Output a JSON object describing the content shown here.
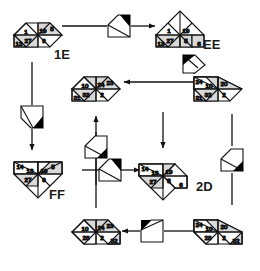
{
  "diagram": {
    "type": "node-link",
    "style": {
      "node_fill_light": "#ffffff",
      "node_fill_shaded": "#d8d8d8",
      "stroke": "#1a1a1a",
      "marker_black": "#000000",
      "background": "#ffffff"
    },
    "labels": [
      {
        "name": "label-1e",
        "text": "1E",
        "x": 54,
        "y": 55
      },
      {
        "name": "label-ee",
        "text": "EE",
        "x": 203,
        "y": 43
      },
      {
        "name": "label-ff",
        "text": "FF",
        "x": 49,
        "y": 191
      },
      {
        "name": "label-2d",
        "text": "2D",
        "x": 196,
        "y": 184
      }
    ],
    "nodes": [
      {
        "name": "node-top-left",
        "id": "n1",
        "cx": 38,
        "cy": 35,
        "cells": [
          {
            "pos": "top-right",
            "value": "5",
            "shaded": false
          },
          {
            "pos": "upper-left",
            "value": "1",
            "shaded": false
          },
          {
            "pos": "upper-right",
            "value": "19",
            "shaded": true
          },
          {
            "pos": "lower-left",
            "value": "27",
            "shaded": true
          },
          {
            "pos": "lower-right",
            "value": "9",
            "shaded": false
          },
          {
            "pos": "bottom-left",
            "value": "13",
            "shaded": true
          }
        ]
      },
      {
        "name": "node-top-right",
        "id": "n2",
        "cx": 180,
        "cy": 35,
        "cells": [
          {
            "pos": "top-right",
            "value": "",
            "shaded": false
          },
          {
            "pos": "upper-left",
            "value": "1",
            "shaded": false
          },
          {
            "pos": "upper-right",
            "value": "19",
            "shaded": false
          },
          {
            "pos": "lower-left",
            "value": "27",
            "shaded": true
          },
          {
            "pos": "lower-right",
            "value": "5",
            "shaded": true
          },
          {
            "pos": "bottom-left",
            "value": "13",
            "shaded": true
          },
          {
            "pos": "bottom-right",
            "value": "6",
            "shaded": true
          }
        ]
      },
      {
        "name": "node-center-upper",
        "id": "n3",
        "cx": 96,
        "cy": 89,
        "cells": [
          {
            "pos": "top-right",
            "value": "23",
            "shaded": true
          },
          {
            "pos": "upper-left",
            "value": "10",
            "shaded": false
          },
          {
            "pos": "upper-right",
            "value": "24",
            "shaded": true
          },
          {
            "pos": "lower-left",
            "value": "32",
            "shaded": true
          },
          {
            "pos": "lower-right",
            "value": "2",
            "shaded": false
          },
          {
            "pos": "bottom-left",
            "value": "31",
            "shaded": false
          }
        ]
      },
      {
        "name": "node-right-upper",
        "id": "n4",
        "cx": 218,
        "cy": 89,
        "cells": [
          {
            "pos": "top-left",
            "value": "24",
            "shaded": true
          },
          {
            "pos": "upper-left",
            "value": "10",
            "shaded": false
          },
          {
            "pos": "upper-right",
            "value": "20",
            "shaded": true
          },
          {
            "pos": "lower-left",
            "value": "32",
            "shaded": true
          },
          {
            "pos": "lower-right",
            "value": "2",
            "shaded": false
          },
          {
            "pos": "bottom-left",
            "value": "31",
            "shaded": false
          }
        ]
      },
      {
        "name": "node-left-lower",
        "id": "n5",
        "cx": 38,
        "cy": 174,
        "cells": [
          {
            "pos": "top-left",
            "value": "14",
            "shaded": false
          },
          {
            "pos": "top-right",
            "value": "5",
            "shaded": false
          },
          {
            "pos": "upper-left",
            "value": "13",
            "shaded": false
          },
          {
            "pos": "upper-right",
            "value": "19",
            "shaded": true
          },
          {
            "pos": "lower-left",
            "value": "27",
            "shaded": true
          },
          {
            "pos": "lower-right",
            "value": "9",
            "shaded": false
          }
        ]
      },
      {
        "name": "node-center-lower",
        "id": "n6",
        "cx": 163,
        "cy": 176,
        "cells": [
          {
            "pos": "top-left",
            "value": "14",
            "shaded": false
          },
          {
            "pos": "upper-left",
            "value": "13",
            "shaded": false
          },
          {
            "pos": "upper-right",
            "value": "19",
            "shaded": true
          },
          {
            "pos": "lower-left",
            "value": "27",
            "shaded": true
          },
          {
            "pos": "lower-right",
            "value": "5",
            "shaded": false
          },
          {
            "pos": "bottom-right",
            "value": "6",
            "shaded": false
          }
        ]
      },
      {
        "name": "node-bottom-middle",
        "id": "n7",
        "cx": 96,
        "cy": 232,
        "cells": [
          {
            "pos": "top-right",
            "value": "23",
            "shaded": true
          },
          {
            "pos": "upper-left",
            "value": "10",
            "shaded": false
          },
          {
            "pos": "upper-right",
            "value": "24",
            "shaded": true
          },
          {
            "pos": "lower-left",
            "value": "28",
            "shaded": false
          },
          {
            "pos": "lower-right",
            "value": "2",
            "shaded": false
          },
          {
            "pos": "bottom-right",
            "value": "32",
            "shaded": true
          }
        ]
      },
      {
        "name": "node-bottom-right",
        "id": "n8",
        "cx": 218,
        "cy": 232,
        "cells": [
          {
            "pos": "top-left",
            "value": "24",
            "shaded": true
          },
          {
            "pos": "upper-left",
            "value": "10",
            "shaded": false
          },
          {
            "pos": "upper-right",
            "value": "20",
            "shaded": true
          },
          {
            "pos": "lower-left",
            "value": "28",
            "shaded": false
          },
          {
            "pos": "lower-right",
            "value": "2",
            "shaded": false
          },
          {
            "pos": "bottom-right",
            "value": "32",
            "shaded": true
          }
        ]
      }
    ],
    "markers": [
      {
        "name": "marker-top",
        "cx": 119,
        "cy": 26,
        "rot": 0,
        "corner": "top-right"
      },
      {
        "name": "marker-left-vertical",
        "cx": 32,
        "cy": 117,
        "rot": -90,
        "corner": "bottom-left"
      },
      {
        "name": "marker-ee-down",
        "cx": 194,
        "cy": 62,
        "rot": -90,
        "corner": "top-left"
      },
      {
        "name": "marker-center-upper",
        "cx": 96,
        "cy": 147,
        "rot": 180,
        "corner": "bottom-right"
      },
      {
        "name": "marker-center-lower",
        "cx": 110,
        "cy": 170,
        "rot": 0,
        "corner": "top-right"
      },
      {
        "name": "marker-right-lower",
        "cx": 232,
        "cy": 160,
        "rot": 0,
        "corner": "bottom-right"
      },
      {
        "name": "marker-bottom",
        "cx": 152,
        "cy": 231,
        "rot": 180,
        "corner": "top-left"
      }
    ],
    "edges": [
      {
        "name": "edge-n1-to-n2",
        "from": "node-top-left",
        "to": "node-top-right"
      },
      {
        "name": "edge-n1-to-n5",
        "from": "node-top-left",
        "to": "node-left-lower"
      },
      {
        "name": "edge-n4-to-n3",
        "from": "node-right-upper",
        "to": "node-center-upper"
      },
      {
        "name": "edge-n2-to-n4",
        "from": "node-top-right",
        "to": "node-right-upper"
      },
      {
        "name": "edge-n3-to-n6",
        "from": "node-center-upper",
        "to": "node-center-lower"
      },
      {
        "name": "edge-n5-to-n6",
        "from": "node-left-lower",
        "to": "node-center-lower"
      },
      {
        "name": "edge-n8-to-n7",
        "from": "node-bottom-right",
        "to": "node-bottom-middle"
      },
      {
        "name": "edge-n7-to-n3",
        "from": "node-bottom-middle",
        "to": "node-center-upper"
      },
      {
        "name": "edge-n4-to-n8",
        "from": "node-right-upper",
        "to": "node-bottom-right"
      }
    ]
  }
}
